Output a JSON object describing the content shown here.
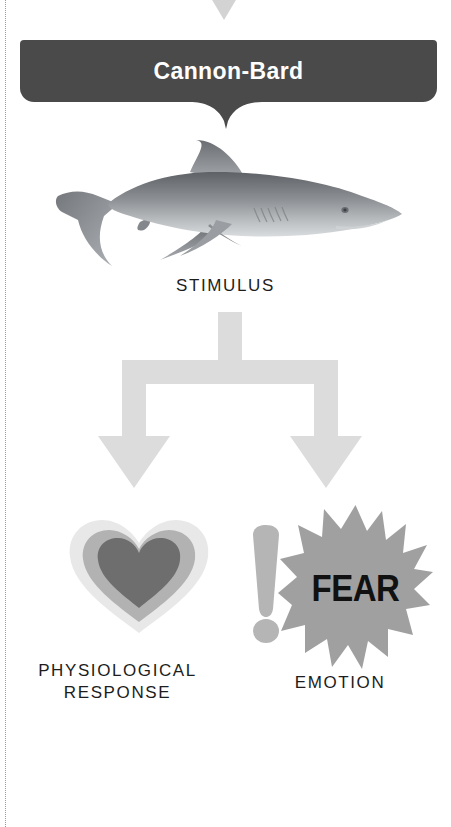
{
  "theme": {
    "background": "#ffffff",
    "banner_bg": "#4a4a4a",
    "banner_text": "#ffffff",
    "label_text": "#1d1d1d",
    "arrow_gray": "#dcdcdc",
    "starburst_gray": "#a0a0a0",
    "exclamation_gray": "#b5b5b5",
    "heart_outer": "#e6e6e6",
    "heart_middle": "#b0b0b0",
    "heart_inner": "#6e6e6e",
    "fear_text": "#111111",
    "cut_line": "#9a9a9a",
    "top_triangle": "#d3d3d3"
  },
  "banner": {
    "title": "Cannon-Bard"
  },
  "diagram": {
    "stimulus_label": "STIMULUS",
    "stimulus_icon": "shark-image",
    "branches": [
      {
        "icon": "heart-icon",
        "label_line1": "PHYSIOLOGICAL",
        "label_line2": "RESPONSE"
      },
      {
        "icon": "starburst-icon",
        "accent_icon": "exclamation-mark-icon",
        "burst_text": "FEAR",
        "label": "EMOTION"
      }
    ],
    "arrow_icon": "fork-down-arrow-icon",
    "top_marker_icon": "down-triangle-icon"
  }
}
